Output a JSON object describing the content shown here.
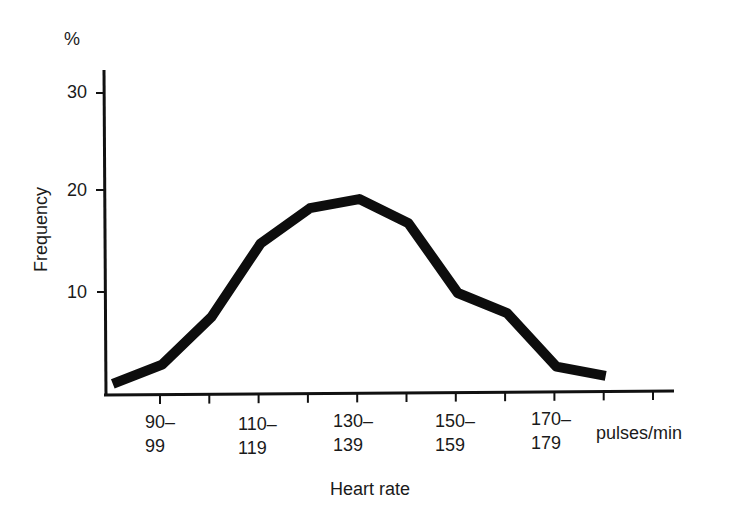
{
  "chart_data": {
    "type": "line",
    "title": "",
    "xlabel": "Heart rate",
    "x_unit": "pulses/min",
    "ylabel": "Frequency",
    "y_unit": "%",
    "ylim": [
      0,
      32
    ],
    "yticks": [
      10,
      20,
      30
    ],
    "ytick_labels": [
      "10",
      "20",
      "30"
    ],
    "grid": false,
    "legend": null,
    "categories": [
      "90–99",
      "110–119",
      "130–139",
      "150–159",
      "170–179"
    ],
    "category_labels": [
      {
        "top": "90–",
        "bottom": "99"
      },
      {
        "top": "110–",
        "bottom": "119"
      },
      {
        "top": "130–",
        "bottom": "139"
      },
      {
        "top": "150–",
        "bottom": "159"
      },
      {
        "top": "170–",
        "bottom": "179"
      }
    ],
    "bins": [
      "85–89",
      "95–99",
      "100–109",
      "110–119",
      "120–129",
      "130–139",
      "140–149",
      "150–159",
      "160–169",
      "170–179",
      "180–189"
    ],
    "series": [
      {
        "name": "Frequency",
        "x": [
          85,
          95,
          105,
          115,
          125,
          135,
          145,
          155,
          165,
          175,
          185
        ],
        "values": [
          1.1,
          3.0,
          7.7,
          15.0,
          18.5,
          19.4,
          17.0,
          10.1,
          8.1,
          2.8,
          1.9
        ]
      }
    ]
  },
  "labels": {
    "y_unit": "%",
    "y_axis_title": "Frequency",
    "x_unit": "pulses/min",
    "x_axis_title": "Heart rate",
    "y_ticks": [
      "30",
      "20",
      "10"
    ]
  }
}
